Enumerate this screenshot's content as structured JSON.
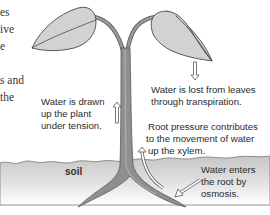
{
  "body_text": {
    "lines": [
      "es",
      "ive",
      "e",
      "",
      "s and",
      "the"
    ]
  },
  "labels": {
    "tension": [
      "Water is drawn",
      "up the plant",
      "under tension."
    ],
    "transpiration": [
      "Water is lost from leaves",
      "through transpiration."
    ],
    "root_pressure": [
      "Root pressure contributes",
      "to the movement of water",
      "up the xylem."
    ],
    "osmosis": [
      "Water enters",
      "the root by",
      "osmosis."
    ],
    "soil": "soil"
  },
  "colors": {
    "leaf_fill": "#d2d2d2",
    "leaf_stroke": "#4a4a4a",
    "stem_fill": "#8f8f8f",
    "stem_highlight": "#c4c4c4",
    "soil_top": "#c9c9c9",
    "soil_bottom": "#ffffff",
    "arrow_stroke": "#555555"
  }
}
